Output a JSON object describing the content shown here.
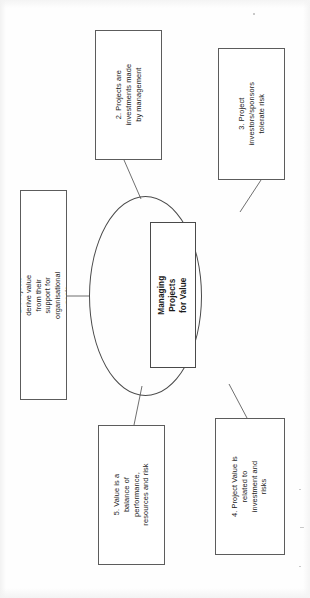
{
  "diagram": {
    "title": "Managing Projects for Value",
    "center": {
      "label": "Managing Projects for Value",
      "shape": "rectangle-in-ellipse",
      "bold": true
    },
    "hub_shape": "ellipse",
    "orientation": "text rotated 90 degrees counter-clockwise (sideways page)",
    "line_color": "#4a4a4a",
    "box_border_color": "#5c5c5c",
    "background_color": "#fefefe",
    "text_color": "#1a1a1a",
    "nodes": [
      {
        "number": "1.",
        "label": "1. Projects derive value from their support for organisational goals",
        "position": "left"
      },
      {
        "number": "2.",
        "label": "2. Projects are investments made by management",
        "position": "top-left"
      },
      {
        "number": "3.",
        "label": "3. Project investors/sponsors tolerate risk",
        "position": "top-right"
      },
      {
        "number": "4.",
        "label": "4. Project Value is related to investment and risks",
        "position": "bottom-right"
      },
      {
        "number": "5.",
        "label": "5. Value is a balance of performance, resources and risk",
        "position": "bottom-left"
      }
    ],
    "connectors": [
      {
        "from": "node-1",
        "to": "center",
        "style": "straight-horizontal"
      },
      {
        "from": "node-2",
        "to": "center",
        "style": "diagonal"
      },
      {
        "from": "node-3",
        "to": "center",
        "style": "diagonal"
      },
      {
        "from": "node-4",
        "to": "center",
        "style": "diagonal"
      },
      {
        "from": "node-5",
        "to": "center",
        "style": "diagonal"
      }
    ]
  }
}
